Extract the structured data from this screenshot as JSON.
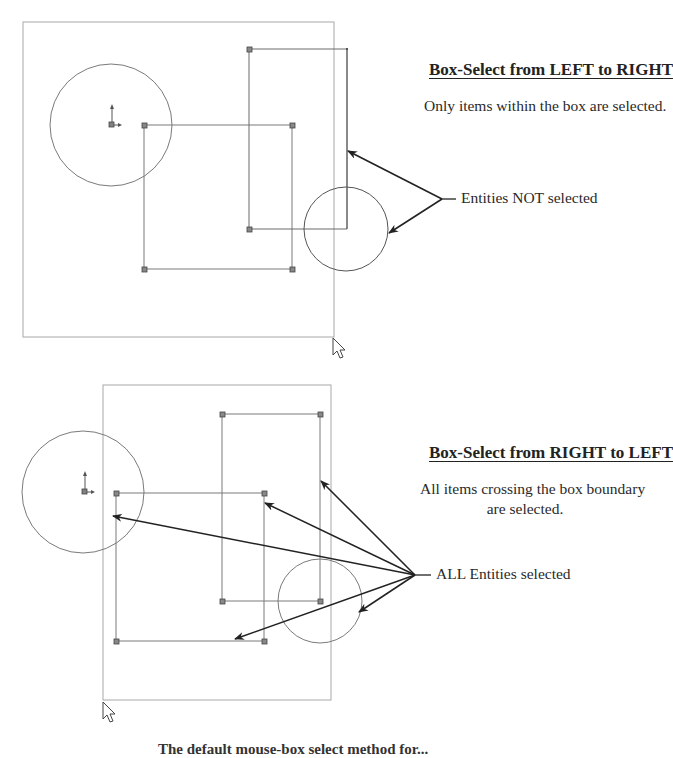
{
  "top_panel": {
    "title": "Box-Select from LEFT to RIGHT",
    "description": "Only items within the box are selected.",
    "callout_label": "Entities NOT selected",
    "selection_box": {
      "x1": 23,
      "y1": 22,
      "x2": 334,
      "y2": 337
    },
    "entities": {
      "circle_left": {
        "cx": 111,
        "cy": 125,
        "r": 61
      },
      "origin": {
        "x": 111,
        "y": 125
      },
      "rect_a": {
        "x1": 144,
        "y1": 125,
        "x2": 292,
        "y2": 269
      },
      "rect_b": {
        "x1": 249,
        "y1": 49,
        "x2": 347,
        "y2": 229
      },
      "circle_right": {
        "cx": 346,
        "cy": 229,
        "r": 42
      }
    },
    "arrow_origin": {
      "x": 442,
      "y": 199
    },
    "arrow_targets": [
      {
        "x": 348,
        "y": 151
      },
      {
        "x": 389,
        "y": 233
      }
    ]
  },
  "bottom_panel": {
    "title": "Box-Select from RIGHT to LEFT",
    "description_line1": "All items crossing the box boundary",
    "description_line2": "are selected.",
    "callout_label": "ALL Entities selected",
    "selection_box": {
      "x1": 103,
      "y1": 385,
      "x2": 331,
      "y2": 700
    },
    "entities": {
      "circle_left": {
        "cx": 83,
        "cy": 492,
        "r": 61
      },
      "origin": {
        "x": 84,
        "y": 492
      },
      "rect_a": {
        "x1": 116,
        "y1": 493,
        "x2": 264,
        "y2": 641
      },
      "rect_b": {
        "x1": 222,
        "y1": 414,
        "x2": 320,
        "y2": 601
      },
      "circle_right": {
        "cx": 320,
        "cy": 601,
        "r": 42
      }
    },
    "arrow_origin": {
      "x": 415,
      "y": 575
    },
    "arrow_targets": [
      {
        "x": 321,
        "y": 481
      },
      {
        "x": 265,
        "y": 503
      },
      {
        "x": 113,
        "y": 516
      },
      {
        "x": 235,
        "y": 639
      },
      {
        "x": 359,
        "y": 612
      }
    ]
  },
  "footer": {
    "caption": "The default mouse-box select method for..."
  },
  "colors": {
    "geometry": "#7a7a7a",
    "selection_box": "#a8a8a8",
    "arrows": "#222222",
    "node_fill": "#808080"
  }
}
